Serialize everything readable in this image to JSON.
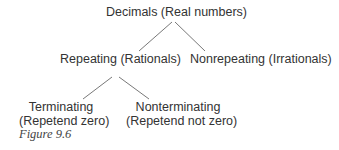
{
  "diagram": {
    "type": "tree",
    "root": {
      "label": "Decimals (Real numbers)"
    },
    "level1": [
      {
        "label": "Repeating (Rationals)"
      },
      {
        "label": "Nonrepeating (Irrationals)"
      }
    ],
    "level2": [
      {
        "line1": "Terminating",
        "line2": "(Repetend zero)"
      },
      {
        "line1": "Nonterminating",
        "line2": "(Repetend not zero)"
      }
    ],
    "caption": "Figure 9.6",
    "line_color": "#555555"
  }
}
